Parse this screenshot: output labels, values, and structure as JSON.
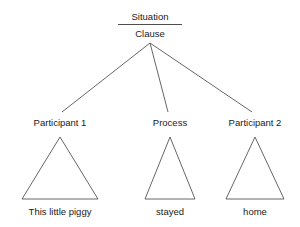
{
  "diagram": {
    "type": "constituency-tree",
    "title_visible": false,
    "background_color": "#ffffff",
    "line_color": "#555555",
    "text_color": "#1a1a1a",
    "root": {
      "upper_label": "Situation",
      "lower_label": "Clause",
      "divider": true
    },
    "branches": [
      {
        "label": "Participant 1",
        "terminal": "This little piggy",
        "apex_x": 150,
        "apex_y": 43,
        "end_x": 62,
        "end_y": 112
      },
      {
        "label": "Process",
        "terminal": "stayed",
        "apex_x": 150,
        "apex_y": 43,
        "end_x": 168,
        "end_y": 112
      },
      {
        "label": "Participant 2",
        "terminal": "home",
        "apex_x": 150,
        "apex_y": 43,
        "end_x": 252,
        "end_y": 112
      }
    ],
    "triangles": [
      {
        "apex_x": 60,
        "apex_y": 137,
        "left_x": 22,
        "right_x": 98,
        "base_y": 199
      },
      {
        "apex_x": 170,
        "apex_y": 137,
        "left_x": 145,
        "right_x": 195,
        "base_y": 199
      },
      {
        "apex_x": 255,
        "apex_y": 137,
        "left_x": 226,
        "right_x": 284,
        "base_y": 199
      }
    ],
    "labels": {
      "root_upper": "Situation",
      "root_lower": "Clause",
      "node_1": "Participant 1",
      "node_2": "Process",
      "node_3": "Participant 2",
      "terminal_1": "This little piggy",
      "terminal_2": "stayed",
      "terminal_3": "home"
    }
  }
}
